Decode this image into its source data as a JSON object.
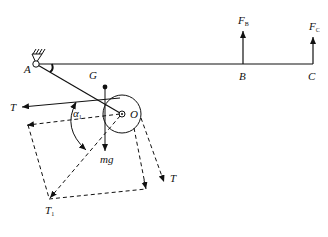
{
  "diagram": {
    "type": "mechanics free-body diagram",
    "colors": {
      "line": "#111111",
      "background": "#ffffff"
    },
    "points": {
      "A": {
        "label": "A"
      },
      "B": {
        "label": "B"
      },
      "C": {
        "label": "C"
      },
      "G": {
        "label": "G"
      },
      "O": {
        "label": "O"
      }
    },
    "forces": {
      "FB": {
        "main": "F",
        "sub": "B"
      },
      "FC": {
        "main": "F",
        "sub": "C"
      },
      "T_left": {
        "label": "T"
      },
      "T_right": {
        "label": "T"
      },
      "T1": {
        "main": "T",
        "sub": "1"
      },
      "mg": {
        "label": "mg"
      }
    },
    "angle": {
      "main": "α",
      "sub": "1"
    }
  }
}
